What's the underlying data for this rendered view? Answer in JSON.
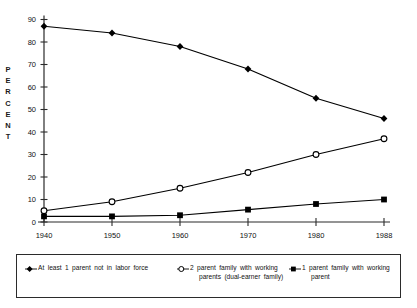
{
  "chart_data": {
    "type": "line",
    "title": "",
    "xlabel": "",
    "ylabel": "PERCENT",
    "ylabel_letters": [
      "P",
      "E",
      "R",
      "C",
      "E",
      "N",
      "T"
    ],
    "categories": [
      "1940",
      "1950",
      "1960",
      "1970",
      "1980",
      "1988"
    ],
    "xtick_labels": [
      "1940",
      "1950",
      "1960",
      "1970",
      "1980",
      "1988"
    ],
    "ytick_labels": [
      "0",
      "10",
      "20",
      "30",
      "40",
      "50",
      "60",
      "70",
      "80",
      "90"
    ],
    "ylim": [
      0,
      90
    ],
    "ytick_step": 10,
    "grid": false,
    "legend_position": "below-plot-boxed",
    "series": [
      {
        "name": "At least 1 parent not in labor force",
        "marker": "filled-diamond",
        "color": "#000000",
        "values": [
          87,
          84,
          78,
          68,
          55,
          46
        ]
      },
      {
        "name": "2 parent family with working parents (dual-earner family)",
        "marker": "open-circle",
        "color": "#000000",
        "values": [
          5,
          9,
          15,
          22,
          30,
          37
        ]
      },
      {
        "name": "1 parent family with working parent",
        "marker": "filled-square",
        "color": "#000000",
        "values": [
          2.5,
          2.5,
          3,
          5.5,
          8,
          10
        ]
      }
    ]
  },
  "legend": {
    "entries": [
      {
        "marker": "filled-diamond",
        "line1": "At least 1 parent not in labor force",
        "line2": ""
      },
      {
        "marker": "open-circle",
        "line1": "2 parent family with working",
        "line2": "parents (dual-earner family)"
      },
      {
        "marker": "filled-square",
        "line1": "1 parent family with working",
        "line2": "parent"
      }
    ]
  },
  "colors": {
    "ink": "#000000",
    "axis": "#2b2b2b",
    "background": "#ffffff"
  }
}
